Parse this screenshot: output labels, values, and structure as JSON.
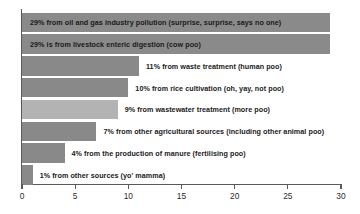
{
  "chart_data": {
    "type": "bar",
    "orientation": "horizontal",
    "title": "",
    "subtitle": "",
    "xlabel": "",
    "ylabel": "",
    "xlim": [
      0,
      30
    ],
    "xticks": [
      0,
      5,
      10,
      15,
      20,
      25,
      30
    ],
    "xtick_labels": [
      "0",
      "5",
      "10",
      "15",
      "20",
      "25",
      "30"
    ],
    "grid": false,
    "legend": "none",
    "unit": "%",
    "categories": [
      "from oil and gas industry pollution (surprise, surprise, says no one)",
      "is from livestock enteric digestion (cow poo)",
      "from waste treatment (human poo)",
      "from rice cultivation (oh, yay, not poo)",
      "from wastewater treatment (more poo)",
      "from other agricultural sources (including other animal poo)",
      "from the production of manure (fertilising poo)",
      "from other sources (yo' mamma)"
    ],
    "values": [
      29,
      29,
      11,
      10,
      9,
      7,
      4,
      1
    ],
    "bars": [
      {
        "value": 29,
        "value_label": "29%",
        "text": "from oil and gas industry pollution (surprise, surprise, says no one)",
        "full_label": "29%  from oil and gas industry pollution (surprise, surprise, says no one)",
        "color": "#8a8a8a",
        "label_position": "inside"
      },
      {
        "value": 29,
        "value_label": "29%",
        "text": "is from livestock enteric digestion (cow poo)",
        "full_label": "29%  is from livestock enteric digestion (cow poo)",
        "color": "#8a8a8a",
        "label_position": "inside"
      },
      {
        "value": 11,
        "value_label": "11%",
        "text": "from waste treatment (human poo)",
        "full_label": "11%  from waste treatment (human poo)",
        "color": "#898989",
        "label_position": "outside"
      },
      {
        "value": 10,
        "value_label": "10%",
        "text": "from rice cultivation (oh, yay, not poo)",
        "full_label": "10%  from rice cultivation (oh, yay, not poo)",
        "color": "#898989",
        "label_position": "outside"
      },
      {
        "value": 9,
        "value_label": "9%",
        "text": "from wastewater treatment (more poo)",
        "full_label": "9%  from wastewater treatment (more poo)",
        "color": "#b3b3b3",
        "label_position": "outside"
      },
      {
        "value": 7,
        "value_label": "7%",
        "text": "from other agricultural sources (including other animal poo)",
        "full_label": "7%  from other agricultural sources (including other animal poo)",
        "color": "#898989",
        "label_position": "outside"
      },
      {
        "value": 4,
        "value_label": "4%",
        "text": "from the production of manure (fertilising poo)",
        "full_label": "4%  from the production of manure (fertilising poo)",
        "color": "#898989",
        "label_position": "outside"
      },
      {
        "value": 1,
        "value_label": "1%",
        "text": "from other sources (yo' mamma)",
        "full_label": "1%  from other sources (yo' mamma)",
        "color": "#898989",
        "label_position": "outside"
      }
    ],
    "colors": {
      "bar_dark": "#8a8a8a",
      "bar_light": "#b3b3b3",
      "axis": "#5a5a5a",
      "text": "#1a1a1a",
      "background": "#ffffff"
    }
  }
}
